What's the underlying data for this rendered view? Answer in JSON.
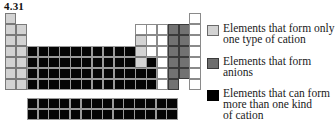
{
  "figure": {
    "label": "4.31"
  },
  "colors": {
    "L": "#d3d3d3",
    "G": "#727272",
    "B": "#050505",
    "W": "#ffffff"
  },
  "legend": [
    {
      "key": "L",
      "label": "Elements that form only one type of cation",
      "lines": [
        "Elements that form only",
        "one type of cation"
      ]
    },
    {
      "key": "G",
      "label": "Elements that form anions",
      "lines": [
        "Elements that form",
        "anions"
      ]
    },
    {
      "key": "B",
      "label": "Elements that can form more than one kind of cation",
      "lines": [
        "Elements that can form",
        "more than one kind",
        "of cation"
      ]
    }
  ],
  "main_table": {
    "columns": 18,
    "rows": [
      [
        "L",
        "-",
        "-",
        "-",
        "-",
        "-",
        "-",
        "-",
        "-",
        "-",
        "-",
        "-",
        "-",
        "-",
        "-",
        "-",
        "-",
        "W"
      ],
      [
        "L",
        "L",
        "-",
        "-",
        "-",
        "-",
        "-",
        "-",
        "-",
        "-",
        "-",
        "-",
        "W",
        "W",
        "W",
        "G",
        "G",
        "W"
      ],
      [
        "L",
        "L",
        "-",
        "-",
        "-",
        "-",
        "-",
        "-",
        "-",
        "-",
        "-",
        "-",
        "L",
        "W",
        "W",
        "G",
        "G",
        "W"
      ],
      [
        "L",
        "L",
        "B",
        "B",
        "B",
        "B",
        "B",
        "B",
        "B",
        "B",
        "B",
        "B",
        "L",
        "W",
        "W",
        "G",
        "G",
        "W"
      ],
      [
        "L",
        "L",
        "B",
        "B",
        "B",
        "B",
        "B",
        "B",
        "B",
        "B",
        "B",
        "B",
        "L",
        "B",
        "W",
        "G",
        "G",
        "W"
      ],
      [
        "L",
        "L",
        "B",
        "B",
        "B",
        "B",
        "B",
        "B",
        "B",
        "B",
        "B",
        "B",
        "B",
        "B",
        "W",
        "G",
        "G",
        "W"
      ],
      [
        "L",
        "L",
        "B",
        "B",
        "B",
        "B",
        "B",
        "B",
        "B",
        "B",
        "B",
        "B",
        "B",
        "B",
        "W",
        "G",
        "-",
        "W"
      ]
    ]
  },
  "f_block": {
    "rows": [
      [
        "B",
        "B",
        "B",
        "B",
        "B",
        "B",
        "B",
        "B",
        "B",
        "B",
        "B",
        "B",
        "B",
        "B"
      ],
      [
        "B",
        "B",
        "B",
        "B",
        "B",
        "B",
        "B",
        "B",
        "B",
        "B",
        "B",
        "B",
        "B",
        "B"
      ]
    ]
  }
}
